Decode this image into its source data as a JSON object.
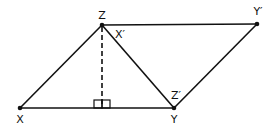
{
  "diagram": {
    "points": {
      "X": {
        "label": "X",
        "x": 20,
        "y": 108,
        "lx": 20,
        "ly": 122
      },
      "Z": {
        "label": "Z",
        "x": 102,
        "y": 25,
        "lx": 102,
        "ly": 18
      },
      "Y": {
        "label": "Y",
        "x": 174,
        "y": 108,
        "lx": 174,
        "ly": 122
      },
      "Yp": {
        "label": "Y′",
        "x": 257,
        "y": 24,
        "lx": 258,
        "ly": 15
      }
    },
    "extra_labels": {
      "Xp": {
        "label": "X′",
        "lx": 120,
        "ly": 38
      },
      "Zp": {
        "label": "Z′",
        "lx": 175,
        "ly": 99
      }
    },
    "foot": {
      "x": 102,
      "y": 108
    },
    "stroke_color": "#111111"
  }
}
